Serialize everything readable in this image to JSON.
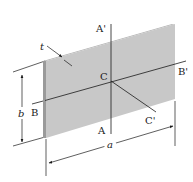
{
  "figure": {
    "colors": {
      "plate_face": "#c8c8c8",
      "plate_edge": "#9a9a9a",
      "plate_top_edge": "#b4b4b4",
      "line": "#1a1a1a",
      "background": "#ffffff"
    },
    "labels": {
      "thickness": "t",
      "axis_a_top": "A'",
      "axis_a_bottom": "A",
      "axis_b_left": "B",
      "axis_b_right": "B'",
      "centroid": "C",
      "axis_c_end": "C'",
      "height_dim": "b",
      "width_dim": "a"
    }
  }
}
